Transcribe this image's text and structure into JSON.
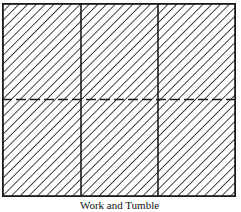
{
  "diagram": {
    "title": "Work and Tumble",
    "layout": {
      "columns": 3,
      "rows": 2,
      "fold_line": "dashed horizontal",
      "fill": "diagonal hatch"
    },
    "colors": {
      "line": "#1a1a1a",
      "background": "#ffffff"
    }
  }
}
